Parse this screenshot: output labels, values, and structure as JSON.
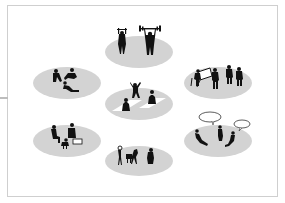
{
  "diagram": {
    "title": "",
    "colors": {
      "ellipse": "#d3d3d3",
      "silhouette": "#111111",
      "frame": "#cfcfcf",
      "mat": "#ffffff"
    },
    "zones": [
      {
        "id": "fitness",
        "label": "",
        "activity": "weightlifting",
        "cx": 139,
        "cy": 49
      },
      {
        "id": "relax",
        "label": "",
        "activity": "lounging",
        "cx": 67,
        "cy": 83
      },
      {
        "id": "meditation",
        "label": "",
        "activity": "yoga-on-mats",
        "cx": 139,
        "cy": 105
      },
      {
        "id": "work",
        "label": "",
        "activity": "standing-at-table",
        "cx": 218,
        "cy": 83
      },
      {
        "id": "dining",
        "label": "",
        "activity": "eating-at-table",
        "cx": 67,
        "cy": 141
      },
      {
        "id": "play",
        "label": "",
        "activity": "playing-music",
        "cx": 139,
        "cy": 161
      },
      {
        "id": "social",
        "label": "",
        "activity": "conversation",
        "cx": 218,
        "cy": 141
      }
    ]
  }
}
